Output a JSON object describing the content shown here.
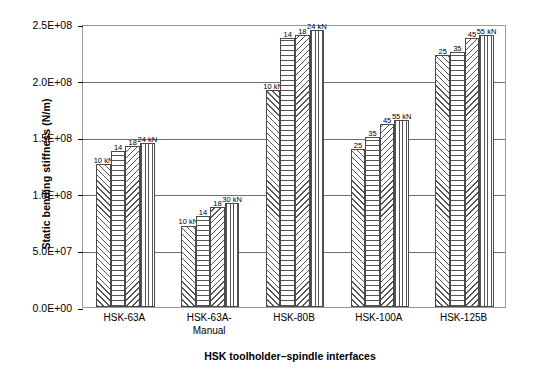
{
  "chart_data": {
    "type": "bar",
    "title": "",
    "xlabel": "HSK toolholder–spindle interfaces",
    "ylabel": "Static bending stiffness (N/m)",
    "categories": [
      "HSK-63A",
      "HSK-63A-\nManual",
      "HSK-80B",
      "HSK-100A",
      "HSK-125B"
    ],
    "ylim": [
      0,
      250000000
    ],
    "yticks": [
      0,
      50000000,
      100000000,
      150000000,
      200000000,
      250000000
    ],
    "ytick_labels": [
      "0.0E+00",
      "5.0E+07",
      "1.0E+08",
      "1.5E+08",
      "2.0E+08",
      "2.5E+08"
    ],
    "grid": true,
    "legend": "none",
    "bar_label_unit": "kN",
    "series": [
      {
        "name": "clamping-force-1",
        "hatch": "diagonal-up",
        "values": [
          126000000,
          72000000,
          192000000,
          140000000,
          223000000
        ],
        "labels": [
          "10 kN",
          "10 kN",
          "10 kN",
          "25",
          "25"
        ]
      },
      {
        "name": "clamping-force-2",
        "hatch": "horizontal",
        "values": [
          138000000,
          80000000,
          238000000,
          150000000,
          225000000
        ],
        "labels": [
          "14",
          "14",
          "14",
          "35",
          "35"
        ]
      },
      {
        "name": "clamping-force-3",
        "hatch": "diagonal-down",
        "values": [
          142000000,
          88000000,
          240000000,
          162000000,
          238000000
        ],
        "labels": [
          "18",
          "18",
          "18",
          "45",
          "45"
        ]
      },
      {
        "name": "clamping-force-4",
        "hatch": "vertical",
        "values": [
          145000000,
          92000000,
          245000000,
          165000000,
          240000000
        ],
        "labels": [
          "24 kN",
          "30  kN",
          "24 kN",
          "55 kN",
          "55 kN"
        ]
      }
    ]
  },
  "colors": {
    "frame": "#9a9a9a",
    "gridline": "#6f6f6f",
    "bar_edge": "#4a4a4a",
    "hatch": "#555555",
    "text": "#000000",
    "background": "#ffffff"
  }
}
